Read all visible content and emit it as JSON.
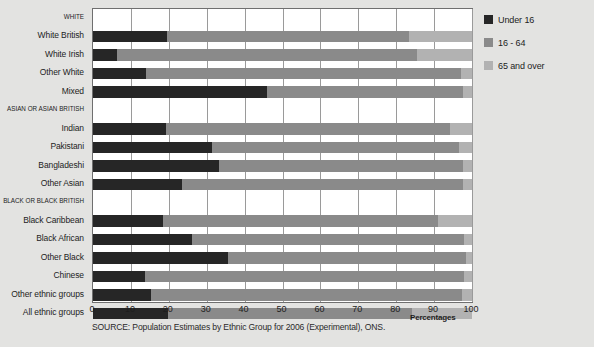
{
  "chart_data": {
    "type": "bar",
    "orientation": "horizontal",
    "stacked": true,
    "percent_stacked": true,
    "title": "",
    "xlabel": "Percentages",
    "ylabel": "",
    "xlim": [
      0,
      100
    ],
    "xticks": [
      "0",
      "10",
      "20",
      "30",
      "40",
      "50",
      "60",
      "70",
      "80",
      "90",
      "100"
    ],
    "grid": true,
    "legend_position": "right",
    "categories": [
      "WHITE",
      "White British",
      "White Irish",
      "Other White",
      "Mixed",
      "ASIAN OR ASIAN BRITISH",
      "Indian",
      "Pakistani",
      "Bangladeshi",
      "Other Asian",
      "BLACK OR BLACK BRITISH",
      "Black Caribbean",
      "Black African",
      "Other Black",
      "Chinese",
      "Other ethnic groups",
      "All ethnic groups"
    ],
    "category_is_header": [
      true,
      false,
      false,
      false,
      false,
      true,
      false,
      false,
      false,
      false,
      true,
      false,
      false,
      false,
      false,
      false,
      false
    ],
    "series": [
      {
        "name": "Under 16",
        "color": "#262626",
        "values": [
          null,
          19.4,
          6.3,
          13.9,
          45.9,
          null,
          19.2,
          31.5,
          33.3,
          23.4,
          null,
          18.6,
          26.0,
          35.7,
          13.6,
          15.3,
          19.9
        ]
      },
      {
        "name": "16 - 64",
        "color": "#8a8a8a",
        "values": [
          null,
          64.1,
          79.2,
          83.1,
          51.6,
          null,
          75.0,
          65.1,
          64.2,
          74.3,
          null,
          72.3,
          72.0,
          62.6,
          84.3,
          82.0,
          64.3
        ]
      },
      {
        "name": "65 and over",
        "color": "#b2b2b2",
        "values": [
          null,
          16.5,
          14.5,
          3.0,
          2.5,
          null,
          5.8,
          3.4,
          2.5,
          2.3,
          null,
          9.1,
          2.0,
          1.7,
          2.1,
          2.7,
          15.8
        ]
      }
    ]
  },
  "legend": {
    "items": [
      {
        "label": "Under 16",
        "color": "#262626"
      },
      {
        "label": "16 - 64",
        "color": "#8a8a8a"
      },
      {
        "label": "65 and over",
        "color": "#b2b2b2"
      }
    ]
  },
  "axis": {
    "x_label": "Percentages"
  },
  "footer": {
    "source": "SOURCE: Population Estimates by Ethnic Group for 2006 (Experimental), ONS."
  },
  "colors": {
    "background": "#e3e3e1",
    "plot_background": "#ffffff",
    "plot_border": "#6f6f6f",
    "gridline": "#9a9a9a",
    "text": "#1d1d1d"
  }
}
